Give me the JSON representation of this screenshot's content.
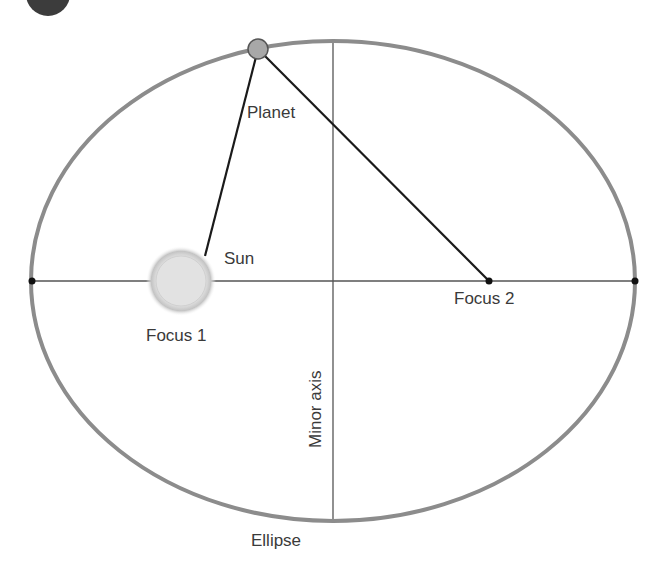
{
  "diagram": {
    "type": "kepler-ellipse-orbit",
    "labels": {
      "planet": "Planet",
      "sun": "Sun",
      "focus1": "Focus 1",
      "focus2": "Focus 2",
      "minor_axis": "Minor axis",
      "ellipse": "Ellipse"
    },
    "colors": {
      "ellipse_stroke": "#8c8c8c",
      "axis_line": "#555555",
      "radius_line": "#1a1a1a",
      "planet_fill": "#a8a8a8",
      "sun_fill": "#e4e4e4",
      "sun_glow": "#bdbdbd",
      "point": "#111111",
      "corner_badge": "#3c3c3c"
    },
    "geometry": {
      "center": [
        333,
        281
      ],
      "rx": 302,
      "ry": 240,
      "focus1": [
        181,
        281
      ],
      "focus2": [
        489,
        281
      ],
      "planet": [
        258,
        49
      ]
    }
  }
}
